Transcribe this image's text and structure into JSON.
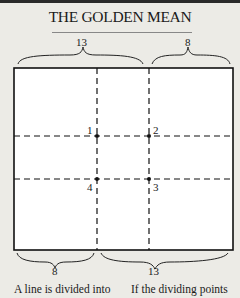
{
  "title": "THE GOLDEN MEAN",
  "diagram": {
    "top_braces": [
      {
        "label": "13"
      },
      {
        "label": "8"
      }
    ],
    "bottom_braces": [
      {
        "label": "8"
      },
      {
        "label": "13"
      }
    ],
    "points": [
      {
        "label": "1"
      },
      {
        "label": "2"
      },
      {
        "label": "3"
      },
      {
        "label": "4"
      }
    ]
  },
  "captions": {
    "left": "A line is divided into",
    "right": "If the dividing points"
  }
}
